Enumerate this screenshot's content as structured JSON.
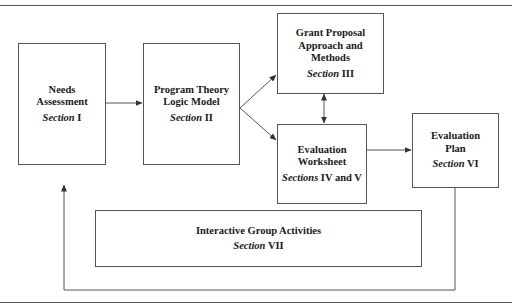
{
  "diagram": {
    "nodes": [
      {
        "id": "needs",
        "title_lines": [
          "Needs",
          "Assessment"
        ],
        "section_word": "Section",
        "section_num": "I"
      },
      {
        "id": "program",
        "title_lines": [
          "Program Theory",
          "Logic Model"
        ],
        "section_word": "Section",
        "section_num": "II"
      },
      {
        "id": "grant",
        "title_lines": [
          "Grant Proposal",
          "Approach and",
          "Methods"
        ],
        "section_word": "Section",
        "section_num": "III"
      },
      {
        "id": "worksheet",
        "title_lines": [
          "Evaluation",
          "Worksheet"
        ],
        "section_word": "Sections",
        "section_num": "IV and V"
      },
      {
        "id": "plan",
        "title_lines": [
          "Evaluation",
          "Plan"
        ],
        "section_word": "Section",
        "section_num": "VI"
      },
      {
        "id": "interactive",
        "title_lines": [
          "Interactive Group Activities"
        ],
        "section_word": "Section",
        "section_num": "VII"
      }
    ],
    "edges": [
      {
        "from": "needs",
        "to": "program"
      },
      {
        "from": "program",
        "to": "grant"
      },
      {
        "from": "program",
        "to": "worksheet"
      },
      {
        "from": "grant",
        "to": "worksheet",
        "bidirectional": true
      },
      {
        "from": "worksheet",
        "to": "plan"
      },
      {
        "from": "plan",
        "to": "needs",
        "route": "loop-bottom"
      }
    ],
    "colors": {
      "line": "#555555",
      "text": "#1a1a1a",
      "background": "#ffffff"
    }
  }
}
